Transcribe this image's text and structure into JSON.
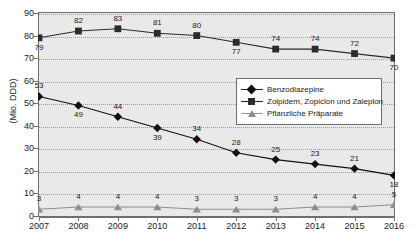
{
  "chart_data": {
    "type": "line",
    "title": "",
    "xlabel": "",
    "ylabel": "(Mio. DDD)",
    "ylim": [
      0,
      90
    ],
    "ytick_step": 10,
    "grid": true,
    "legend_position": "center-right",
    "categories": [
      "2007",
      "2008",
      "2009",
      "2010",
      "2011",
      "2012",
      "2013",
      "2014",
      "2015",
      "2016"
    ],
    "yticks": [
      "0",
      "10",
      "20",
      "30",
      "40",
      "50",
      "60",
      "70",
      "80",
      "90"
    ],
    "series": [
      {
        "name": "Benzodiazepine",
        "marker": "diamond",
        "color": "#111111",
        "values": [
          53,
          49,
          44,
          39,
          34,
          28,
          25,
          23,
          21,
          18
        ],
        "label_positions": [
          "above",
          "below",
          "above",
          "below",
          "above",
          "above",
          "above",
          "above",
          "above",
          "below"
        ]
      },
      {
        "name": "Zolpidem, Zopiclon und Zaleplon",
        "marker": "square",
        "color": "#2b2b2b",
        "values": [
          79,
          82,
          83,
          81,
          80,
          77,
          74,
          74,
          72,
          70
        ],
        "label_positions": [
          "below",
          "above",
          "above",
          "above",
          "above",
          "below",
          "above",
          "above",
          "above",
          "below"
        ]
      },
      {
        "name": "Pflanzliche Präparate",
        "marker": "triangle",
        "color": "#8e8e8e",
        "values": [
          3,
          4,
          4,
          4,
          3,
          3,
          3,
          4,
          4,
          5
        ],
        "label_positions": [
          "above",
          "above",
          "above",
          "above",
          "above",
          "above",
          "above",
          "above",
          "above",
          "above"
        ]
      }
    ]
  }
}
